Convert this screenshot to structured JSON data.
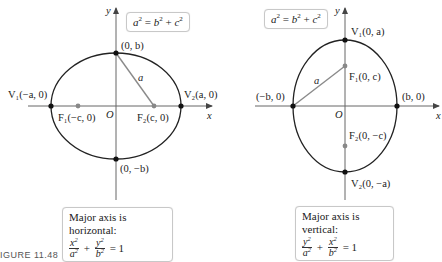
{
  "figure": {
    "caption": "FIGURE 11.48",
    "colors": {
      "curve": "#222222",
      "axis": "#555555",
      "focus": "#888888",
      "segment": "#8a8a8a",
      "box_border": "#c8c8c8"
    }
  },
  "left": {
    "relation": {
      "lhs": "a",
      "rhs1": "b",
      "rhs2": "c",
      "op_eq": "=",
      "op_plus": "+"
    },
    "axis_labels": {
      "x": "x",
      "y": "y",
      "origin": "O"
    },
    "points": {
      "top": "(0, b)",
      "bottom": "(0, −b)",
      "v1": "V₁(−a, 0)",
      "v2": "V₂(a, 0)",
      "f1": "F₁(−c, 0)",
      "f2": "F₂(c, 0)"
    },
    "segment_label": "a",
    "box": {
      "title": "Major axis is horizontal:",
      "term1_num": "x",
      "term1_den": "a",
      "term2_num": "y",
      "term2_den": "b",
      "plus": "+",
      "equals": "= 1"
    }
  },
  "right": {
    "relation": {
      "lhs": "a",
      "rhs1": "b",
      "rhs2": "c",
      "op_eq": "=",
      "op_plus": "+"
    },
    "axis_labels": {
      "x": "x",
      "y": "y",
      "origin": "O"
    },
    "points": {
      "top": "V₁(0, a)",
      "bottom": "V₂(0, −a)",
      "left": "(−b, 0)",
      "right": "(b, 0)",
      "f1": "F₁(0, c)",
      "f2": "F₂(0, −c)"
    },
    "segment_label": "a",
    "box": {
      "title": "Major axis is vertical:",
      "term1_num": "y",
      "term1_den": "a",
      "term2_num": "x",
      "term2_den": "b",
      "plus": "+",
      "equals": "= 1"
    }
  }
}
